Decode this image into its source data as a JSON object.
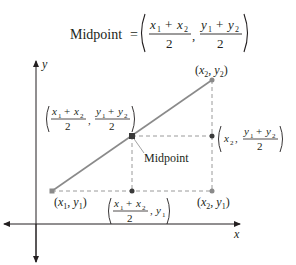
{
  "formula": {
    "lhs": "Midpoint",
    "equals": "=",
    "num_x": "x",
    "num_x_sub1": "1",
    "plus": "+",
    "num_x_sub2": "2",
    "den": "2",
    "comma": ",",
    "num_y": "y"
  },
  "axes": {
    "x_label": "x",
    "y_label": "y"
  },
  "labels": {
    "p2": "(x₂, y₂)",
    "p1": "(x₁, y₁)",
    "p3": "(x₂, y₁)",
    "midpoint_caption": "Midpoint",
    "midpoint_coord": "((x₁ + x₂)/2, (y₁ + y₂)/2)",
    "right_coord": "(x₂, (y₁ + y₂)/2)",
    "bottom_coord": "((x₁ + x₂)/2, y₁)"
  },
  "points": {
    "p1": {
      "x": 52,
      "y": 191
    },
    "p2": {
      "x": 212,
      "y": 80
    },
    "mid": {
      "x": 132,
      "y": 136
    },
    "right": {
      "x": 212,
      "y": 136
    },
    "bottom": {
      "x": 132,
      "y": 191
    },
    "corner": {
      "x": 212,
      "y": 191
    }
  },
  "colors": {
    "segment": "#8a8a8a",
    "dashed": "#9a9a9a",
    "text": "#231f20",
    "mid_dot": "#3a3a3a"
  }
}
